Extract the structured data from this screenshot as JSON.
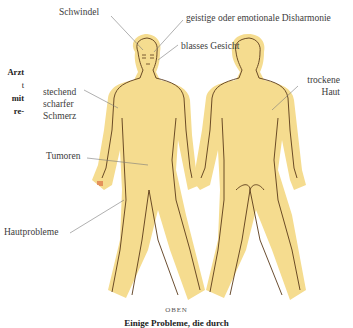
{
  "sidebar_fragment": [
    "Arzt",
    "t",
    "mit",
    "re-"
  ],
  "labels": {
    "schwindel": "Schwindel",
    "disharmonie": "geistige oder emotionale Disharmonie",
    "blasses_gesicht": "blasses Gesicht",
    "stechend_1": "stechend",
    "stechend_2": "scharfer",
    "stechend_3": "Schmerz",
    "tumoren": "Tumoren",
    "hautprobleme": "Hautprobleme",
    "trockene_1": "trockene",
    "trockene_2": "Haut"
  },
  "caption": {
    "top": "OBEN",
    "bottom": "Einige Probleme, die durch"
  },
  "colors": {
    "body_fill": "#f5dc8f",
    "outline": "#5a3a1a",
    "leader": "#7a7a7a",
    "nails": "#d9603a"
  }
}
